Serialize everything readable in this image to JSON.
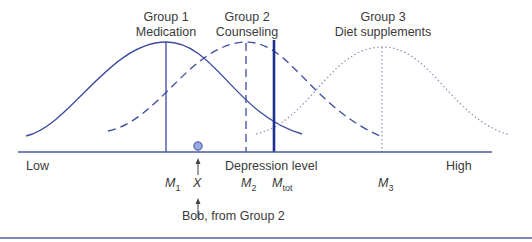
{
  "groups": [
    {
      "name": "Group 1",
      "treatment": "Medication",
      "mean_label": "M",
      "mean_sub": "1",
      "line_style": "solid"
    },
    {
      "name": "Group 2",
      "treatment": "Counseling",
      "mean_label": "M",
      "mean_sub": "2",
      "line_style": "dashed"
    },
    {
      "name": "Group 3",
      "treatment": "Diet supplements",
      "mean_label": "M",
      "mean_sub": "3",
      "line_style": "dotted"
    }
  ],
  "total_mean": {
    "label": "M",
    "sub": "tot"
  },
  "axis": {
    "low": "Low",
    "high": "High",
    "title": "Depression level"
  },
  "individual": {
    "symbol": "X",
    "caption": "Bob, from Group 2"
  },
  "colors": {
    "curve": "#3d4a9e",
    "total_line": "#1f2f8f",
    "dot_fill": "#9aaae0",
    "axis": "#4a5a9e",
    "text": "#3a3a3a"
  }
}
